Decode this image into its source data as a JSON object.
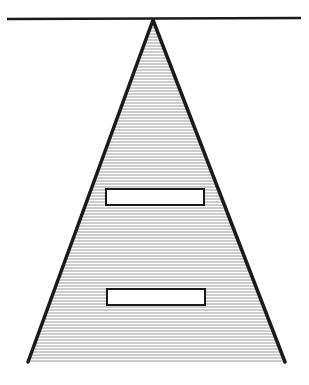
{
  "diagram": {
    "colors": {
      "background": "#ffffff",
      "stroke": "#1a1a1a",
      "hatch": "#9a9a9a",
      "box_fill": "#ffffff"
    },
    "top_line": {
      "x1": 7,
      "y1": 19,
      "x2": 301,
      "y2": 18
    },
    "triangle": {
      "apex": [
        153,
        20
      ],
      "bottom_left": [
        28,
        362
      ],
      "bottom_right": [
        285,
        362
      ],
      "fill": "horizontal-hatch",
      "bottom_edge": false
    },
    "boxes": [
      {
        "label": "",
        "x": 106,
        "y": 189,
        "width": 98,
        "height": 16
      },
      {
        "label": "",
        "x": 107,
        "y": 289,
        "width": 98,
        "height": 16
      }
    ]
  }
}
